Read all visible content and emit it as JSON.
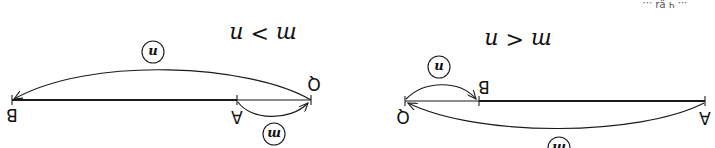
{
  "orientation": "rotated-180",
  "top_right_fragment": "... ч ɐ̤ɹ ...",
  "diagrams": [
    {
      "id": "left",
      "relation": "m > n",
      "points": {
        "B": "B",
        "A": "A",
        "Q": "Q"
      },
      "arcs": [
        {
          "from": "Q",
          "to": "B",
          "label": "n"
        },
        {
          "from": "A",
          "to": "Q",
          "label": "m"
        }
      ]
    },
    {
      "id": "right",
      "relation": "m < n",
      "points": {
        "Q": "Q",
        "B": "B",
        "A": "A"
      },
      "arcs": [
        {
          "from": "Q",
          "to": "B",
          "label": "n"
        },
        {
          "from": "A",
          "to": "Q",
          "label": "m"
        }
      ]
    }
  ],
  "colors": {
    "ink": "#1a1a1a",
    "background": "#ffffff"
  }
}
